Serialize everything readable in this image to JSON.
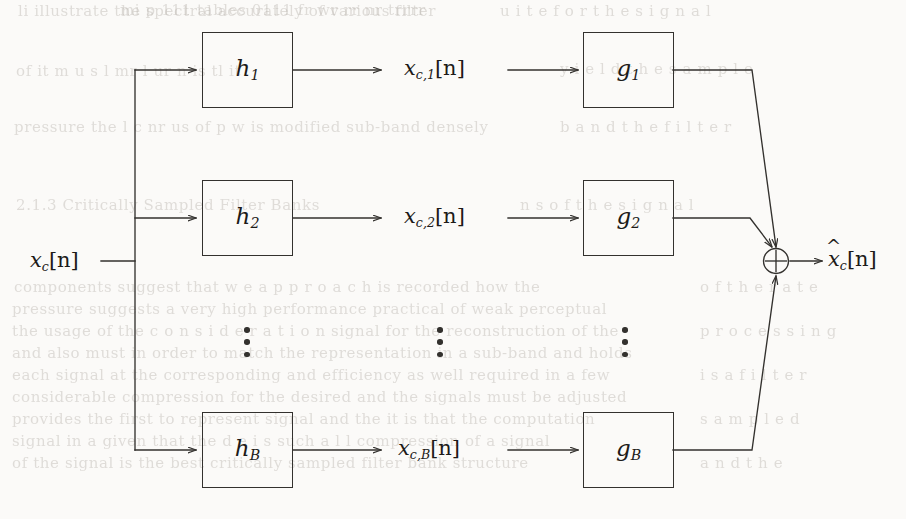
{
  "figure": {
    "kind": "block-diagram",
    "background_color": "#fbfaf8",
    "ink_color": "#1d1b19",
    "line_color": "#33312e"
  },
  "signals": {
    "input": {
      "base": "x",
      "sub": "c",
      "index": "[n]",
      "full": "x_c[n]"
    },
    "output": {
      "base": "x",
      "hat": "^",
      "sub": "c",
      "index": "[n]",
      "full": "x̂_c[n]"
    },
    "subbands": [
      {
        "base": "x",
        "sub": "c,1",
        "index": "[n]",
        "full": "x_c,1[n]"
      },
      {
        "base": "x",
        "sub": "c,2",
        "index": "[n]",
        "full": "x_c,2[n]"
      },
      {
        "base": "x",
        "sub": "c,B",
        "index": "[n]",
        "full": "x_c,B[n]"
      }
    ]
  },
  "analysis_filters": [
    {
      "base": "h",
      "sub": "1",
      "full": "h_1"
    },
    {
      "base": "h",
      "sub": "2",
      "full": "h_2"
    },
    {
      "base": "h",
      "sub": "B",
      "full": "h_B"
    }
  ],
  "synthesis_filters": [
    {
      "base": "g",
      "sub": "1",
      "full": "g_1"
    },
    {
      "base": "g",
      "sub": "2",
      "full": "g_2"
    },
    {
      "base": "g",
      "sub": "B",
      "full": "g_B"
    }
  ],
  "adder": {
    "symbol": "+",
    "glyph": "circled-plus",
    "name": "summing-junction"
  },
  "ellipsis": {
    "glyph": "vertical-dots",
    "count": 3,
    "columns": [
      "analysis-column",
      "subband-column",
      "synthesis-column"
    ]
  },
  "ghost_text": {
    "note": "faint bleed-through text from the reverse side of the scanned page",
    "lines": [
      {
        "x": 18,
        "y": 2,
        "text": "li  illustrate  the  spectral  accurately  of  various  filter"
      },
      {
        "x": 120,
        "y": 1,
        "text": "mi p  111  tables  0111  fr  wr  rr  nr  trrrr"
      },
      {
        "x": 16,
        "y": 62,
        "text": "of  it   m  u  s  l    mr    l  ur    n  is  tl  it"
      },
      {
        "x": 14,
        "y": 118,
        "text": "pressure  the  l  c  nr  us  of   p   w  is  modified  sub-band  densely"
      },
      {
        "x": 16,
        "y": 196,
        "text": "2.1.3  Critically  Sampled  Filter  Banks"
      },
      {
        "x": 14,
        "y": 278,
        "text": "components  suggest  that   w  e   a  p  p  r  o  a  c  h     is  recorded  how  the"
      },
      {
        "x": 12,
        "y": 300,
        "text": "pressure  suggests  a  very  high  performance  practical  of   weak  perceptual"
      },
      {
        "x": 12,
        "y": 322,
        "text": "the  usage  of   the   c  o  n  s  i  d  e  r  a  t  i  o  n     signal   for  the   reconstruction  of  the"
      },
      {
        "x": 12,
        "y": 344,
        "text": "and  also   must  in  order  to  match  the  representation  in  a   sub-band  and  holds"
      },
      {
        "x": 12,
        "y": 366,
        "text": "each   signal   at   the   corresponding   and   efficiency   as  well    required   in   a   few"
      },
      {
        "x": 12,
        "y": 388,
        "text": "considerable   compression   for   the  desired   and   the   signals   must   be   adjusted"
      },
      {
        "x": 12,
        "y": 410,
        "text": "provides   the   first   to   represent   signal   and   the   it   is   that   the   computation"
      },
      {
        "x": 12,
        "y": 432,
        "text": "signal   in   a   given   that   the   d  e   i  s    such   a  l  l    compression   of   a   signal"
      },
      {
        "x": 12,
        "y": 454,
        "text": "of   the   signal   is   the   best   critically   sampled   filter   bank   structure"
      },
      {
        "x": 500,
        "y": 2,
        "text": "u  i  t  e    f  o  r    t  h  e    s  i  g  n  a  l"
      },
      {
        "x": 560,
        "y": 60,
        "text": "y  i  e  l  d    t  h  e    s  a  m  p  l  e"
      },
      {
        "x": 560,
        "y": 118,
        "text": "b  a  n  d    t  h  e    f  i  l  t  e  r"
      },
      {
        "x": 520,
        "y": 196,
        "text": "n  s    o  f    t  h  e    s  i  g  n  a  l"
      },
      {
        "x": 700,
        "y": 278,
        "text": "o  f    t  h  e    r  a  t  e"
      },
      {
        "x": 700,
        "y": 322,
        "text": "p  r  o  c  e  s  s  i  n  g"
      },
      {
        "x": 700,
        "y": 366,
        "text": "i  s    a    f  i  l  t  e  r"
      },
      {
        "x": 700,
        "y": 410,
        "text": "s  a  m  p  l  e  d"
      },
      {
        "x": 700,
        "y": 454,
        "text": "a  n  d    t  h  e"
      }
    ]
  }
}
